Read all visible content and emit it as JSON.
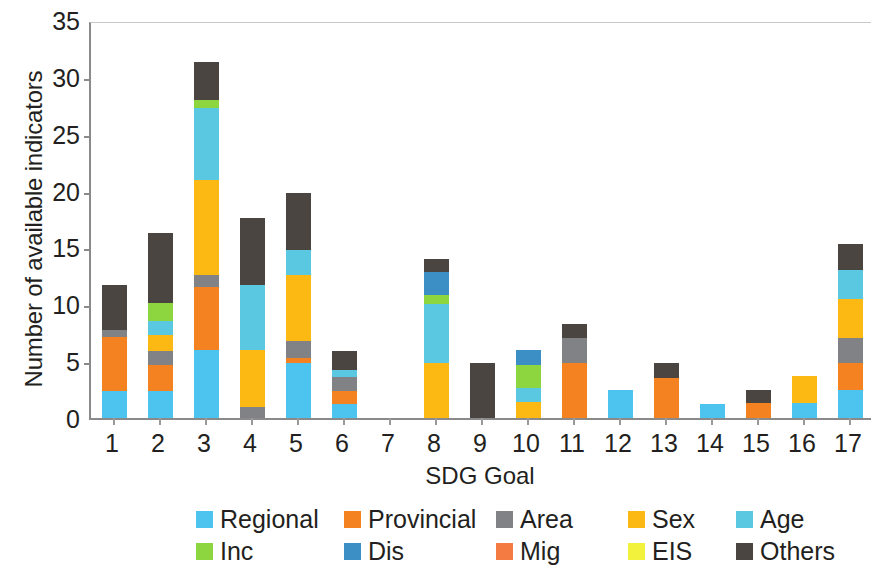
{
  "chart_data": {
    "type": "bar",
    "subtype": "stacked-bar",
    "title": "",
    "xlabel": "SDG Goal",
    "ylabel": "Number of available indicators",
    "categories": [
      "1",
      "2",
      "3",
      "4",
      "5",
      "6",
      "7",
      "8",
      "9",
      "10",
      "11",
      "12",
      "13",
      "14",
      "15",
      "16",
      "17"
    ],
    "ylim": [
      0,
      35
    ],
    "yticks": [
      0,
      5,
      10,
      15,
      20,
      25,
      30,
      35
    ],
    "ytick_labels": [
      "0",
      "5",
      "10",
      "15",
      "20",
      "25",
      "30",
      "35"
    ],
    "grid": false,
    "legend_position": "bottom",
    "stack_order_bottom_to_top": [
      "Regional",
      "Provincial",
      "Area",
      "Sex",
      "Age",
      "Inc",
      "Dis",
      "Mig",
      "EIS",
      "Others"
    ],
    "series": [
      {
        "name": "Regional",
        "color": "#4dc4f0",
        "values": [
          2.4,
          2.4,
          6.0,
          0.0,
          4.8,
          1.2,
          0.0,
          0.0,
          0.0,
          0.0,
          0.0,
          2.5,
          0.0,
          1.2,
          0.0,
          1.3,
          2.5
        ]
      },
      {
        "name": "Provincial",
        "color": "#f58220",
        "values": [
          4.7,
          2.3,
          5.5,
          0.0,
          0.5,
          1.2,
          0.0,
          0.0,
          0.0,
          0.0,
          4.8,
          0.0,
          3.5,
          0.0,
          1.3,
          0.0,
          2.3
        ]
      },
      {
        "name": "Area",
        "color": "#808285",
        "values": [
          0.6,
          1.2,
          1.1,
          1.0,
          1.5,
          1.2,
          0.0,
          0.0,
          0.0,
          0.0,
          2.2,
          0.0,
          0.0,
          0.0,
          0.0,
          0.0,
          2.2
        ]
      },
      {
        "name": "Sex",
        "color": "#fdb913",
        "values": [
          0.0,
          1.4,
          8.3,
          5.0,
          5.8,
          0.0,
          0.0,
          4.8,
          0.0,
          1.4,
          0.0,
          0.0,
          0.0,
          0.0,
          0.0,
          2.4,
          3.5
        ]
      },
      {
        "name": "Age",
        "color": "#5bc8e2",
        "values": [
          0.0,
          1.2,
          6.4,
          5.7,
          2.2,
          0.6,
          0.0,
          5.2,
          0.0,
          1.2,
          0.0,
          0.0,
          0.0,
          0.0,
          0.0,
          0.0,
          2.5
        ]
      },
      {
        "name": "Inc",
        "color": "#8dd63f",
        "values": [
          0.0,
          1.6,
          0.7,
          0.0,
          0.0,
          0.0,
          0.0,
          0.8,
          0.0,
          2.1,
          0.0,
          0.0,
          0.0,
          0.0,
          0.0,
          0.0,
          0.0
        ]
      },
      {
        "name": "Dis",
        "color": "#3c8fc4",
        "values": [
          0.0,
          0.0,
          0.0,
          0.0,
          0.0,
          0.0,
          0.0,
          2.0,
          0.0,
          1.3,
          0.0,
          0.0,
          0.0,
          0.0,
          0.0,
          0.0,
          0.0
        ]
      },
      {
        "name": "Mig",
        "color": "#f47b42",
        "values": [
          0.0,
          0.0,
          0.0,
          0.0,
          0.0,
          0.0,
          0.0,
          0.0,
          0.0,
          0.0,
          0.0,
          0.0,
          0.0,
          0.0,
          0.0,
          0.0,
          0.0
        ]
      },
      {
        "name": "EIS",
        "color": "#f2f23c",
        "values": [
          0.0,
          0.0,
          0.0,
          0.0,
          0.0,
          0.0,
          0.0,
          0.0,
          0.0,
          0.0,
          0.0,
          0.0,
          0.0,
          0.0,
          0.0,
          0.0,
          0.0
        ]
      },
      {
        "name": "Others",
        "color": "#4a4541",
        "values": [
          4.0,
          6.2,
          3.3,
          5.9,
          5.0,
          1.7,
          0.0,
          1.2,
          4.8,
          0.0,
          1.3,
          0.0,
          1.3,
          0.0,
          1.2,
          0.0,
          2.3
        ]
      }
    ],
    "totals": [
      11.7,
      16.3,
      31.3,
      17.6,
      19.8,
      5.9,
      0.0,
      14.0,
      4.8,
      6.0,
      8.3,
      2.5,
      4.8,
      1.2,
      2.5,
      3.7,
      15.3
    ]
  },
  "legend": {
    "rows": [
      [
        {
          "label": "Regional",
          "color": "#4dc4f0"
        },
        {
          "label": "Provincial",
          "color": "#f58220"
        },
        {
          "label": "Area",
          "color": "#808285"
        },
        {
          "label": "Sex",
          "color": "#fdb913"
        },
        {
          "label": "Age",
          "color": "#5bc8e2"
        }
      ],
      [
        {
          "label": "Inc",
          "color": "#8dd63f"
        },
        {
          "label": "Dis",
          "color": "#3c8fc4"
        },
        {
          "label": "Mig",
          "color": "#f47b42"
        },
        {
          "label": "EIS",
          "color": "#f2f23c"
        },
        {
          "label": "Others",
          "color": "#4a4541"
        }
      ]
    ]
  }
}
